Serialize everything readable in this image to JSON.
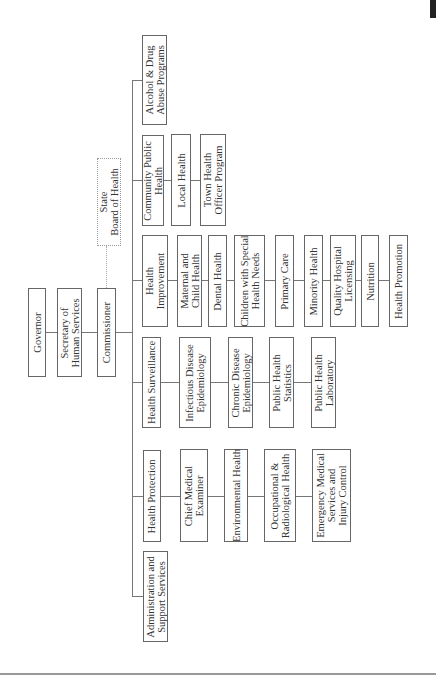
{
  "chart_title": "",
  "top": {
    "governor": "Governor",
    "secretary": "Secretary of\nHuman Services",
    "commissioner": "Commissioner",
    "board": "State\nBoard of Health"
  },
  "divisions": [
    {
      "name": "Alcohol & Drug\nAbuse Programs",
      "units": []
    },
    {
      "name": "Community Public\nHealth",
      "units": [
        "Local Health",
        "Town Health\nOfficer Program"
      ]
    },
    {
      "name": "Health\nImprovement",
      "units": [
        "Maternal and\nChild Health",
        "Dental Health",
        "Children with Special\nHealth Needs",
        "Primary Care",
        "Minority Health",
        "Quality Hospital\nLicensing",
        "Nutrition",
        "Health Promotion"
      ]
    },
    {
      "name": "Health Surveillance",
      "units": [
        "Infectious Disease\nEpidemiology",
        "Chronic Disease\nEpidemiology",
        "Public Health\nStatistics",
        "Public Health\nLaboratory"
      ]
    },
    {
      "name": "Health Protection",
      "units": [
        "Chief Medical\nExaminer",
        "Environmental Health",
        "Occupational &\nRadiological Health",
        "Emergency Medical\nServices and\nInjury Control"
      ]
    },
    {
      "name": "Administration and\nSupport Services",
      "units": []
    }
  ],
  "colors": {
    "line": "#777777",
    "border": "#666666",
    "dotted_border": "#999999"
  }
}
